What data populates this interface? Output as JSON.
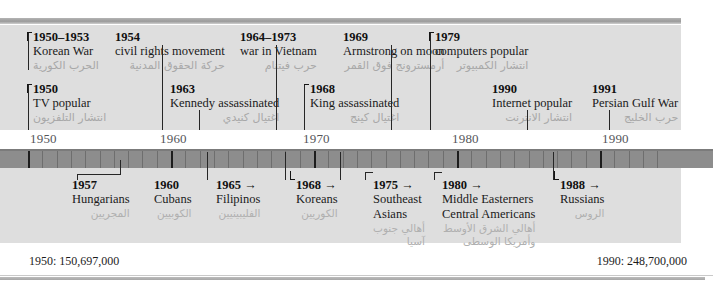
{
  "axis": {
    "start_year": 1950,
    "end_year": 1994,
    "decade_labels": [
      "1950",
      "1960",
      "1970",
      "1980",
      "1990"
    ]
  },
  "upper_events": [
    {
      "year": "1950–1953",
      "label": "Korean War",
      "arabic": "الحرب الكورية",
      "bracket": true
    },
    {
      "year": "1954",
      "label": "civil rights movement",
      "arabic": "حركة الحقوق المدنية",
      "bracket": false
    },
    {
      "year": "1964–1973",
      "label": "war in Vietnam",
      "arabic": "حرب فيتنام",
      "bracket": false
    },
    {
      "year": "1969",
      "label": "Armstrong on moon",
      "arabic": "أرمسترونج فوق القمر",
      "bracket": false
    },
    {
      "year": "1979",
      "label": "computers popular",
      "arabic": "انتشار الكمبيوتر",
      "bracket": true
    },
    {
      "year": "1950",
      "label": "TV popular",
      "arabic": "انتشار التلفزيون",
      "bracket": true
    },
    {
      "year": "1963",
      "label": "Kennedy assassinated",
      "arabic": "اغتيال كنيدي",
      "bracket": false
    },
    {
      "year": "1968",
      "label": "King assassinated",
      "arabic": "اغتيال كينج",
      "bracket": true
    },
    {
      "year": "1990",
      "label": "Internet popular",
      "arabic": "انتشار الانترنت",
      "bracket": false
    },
    {
      "year": "1991",
      "label": "Persian Gulf War",
      "arabic": "حرب الخليج",
      "bracket": false
    }
  ],
  "migration_groups": [
    {
      "year": "1957",
      "label": "Hungarians",
      "label2": "",
      "arabic": "المجريين",
      "arabic2": ""
    },
    {
      "year": "1960",
      "label": "Cubans",
      "label2": "",
      "arabic": "الكوبيين",
      "arabic2": ""
    },
    {
      "year": "1965 →",
      "label": "Filipinos",
      "label2": "",
      "arabic": "الفليبينيين",
      "arabic2": ""
    },
    {
      "year": "1968 →",
      "label": "Koreans",
      "label2": "",
      "arabic": "الكوريين",
      "arabic2": ""
    },
    {
      "year": "1975 →",
      "label": "Southeast",
      "label2": "Asians",
      "arabic": "أهالي جنوب",
      "arabic2": "آسيا"
    },
    {
      "year": "1980 →",
      "label": "Middle Easterners",
      "label2": "Central Americans",
      "arabic": "أهالي الشرق الأوسط",
      "arabic2": "وأمريكا الوسطى"
    },
    {
      "year": "1988 →",
      "label": "Russians",
      "label2": "",
      "arabic": "الروس",
      "arabic2": ""
    }
  ],
  "footer": {
    "left": "1950: 150,697,000",
    "right": "1990: 248,700,000"
  },
  "colors": {
    "panel": "#dedede",
    "ruler": "#8d8d8d",
    "arabic_text": "#a8a8a8",
    "primary_text": "#1a1a1a",
    "decade_text": "#55565a"
  }
}
